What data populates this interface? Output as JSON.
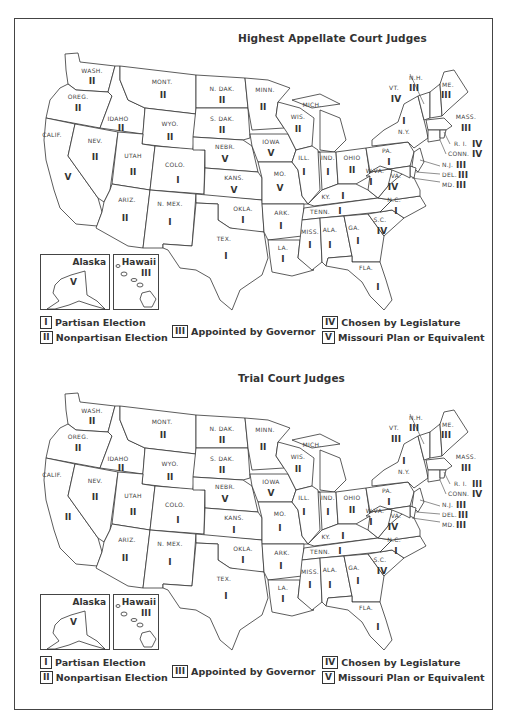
{
  "legend": [
    {
      "code": "I",
      "label": "Partisan Election"
    },
    {
      "code": "II",
      "label": "Nonpartisan Election"
    },
    {
      "code": "III",
      "label": "Appointed by Governor"
    },
    {
      "code": "IV",
      "label": "Chosen by Legislature"
    },
    {
      "code": "V",
      "label": "Missouri Plan or Equivalent"
    }
  ],
  "maps": [
    {
      "title": "Highest Appellate Court Judges",
      "alaska": {
        "name": "Alaska",
        "code": "V"
      },
      "hawaii": {
        "name": "Hawaii",
        "code": "III"
      },
      "states": {
        "WASH": {
          "label": "WASH.",
          "code": "II"
        },
        "OREG": {
          "label": "OREG.",
          "code": "II"
        },
        "CALIF": {
          "label": "CALIF.",
          "code": "V"
        },
        "IDAHO": {
          "label": "IDAHO",
          "code": "II"
        },
        "NEV": {
          "label": "NEV.",
          "code": "II"
        },
        "MONT": {
          "label": "MONT.",
          "code": "II"
        },
        "WYO": {
          "label": "WYO.",
          "code": "II"
        },
        "UTAH": {
          "label": "UTAH",
          "code": "II"
        },
        "COLO": {
          "label": "COLO.",
          "code": "I"
        },
        "ARIZ": {
          "label": "ARIZ.",
          "code": "II"
        },
        "NMEX": {
          "label": "N. MEX.",
          "code": "I"
        },
        "NDAK": {
          "label": "N. DAK.",
          "code": "II"
        },
        "SDAK": {
          "label": "S. DAK.",
          "code": "II"
        },
        "NEBR": {
          "label": "NEBR.",
          "code": "V"
        },
        "KANS": {
          "label": "KANS.",
          "code": "V"
        },
        "OKLA": {
          "label": "OKLA.",
          "code": "I"
        },
        "TEX": {
          "label": "TEX.",
          "code": "I"
        },
        "MINN": {
          "label": "MINN.",
          "code": "II"
        },
        "IOWA": {
          "label": "IOWA",
          "code": "V"
        },
        "MO": {
          "label": "MO.",
          "code": "V"
        },
        "ARK": {
          "label": "ARK.",
          "code": "I"
        },
        "LA": {
          "label": "LA.",
          "code": "I"
        },
        "WIS": {
          "label": "WIS.",
          "code": "II"
        },
        "ILL": {
          "label": "ILL.",
          "code": "I"
        },
        "MICH": {
          "label": "MICH.",
          "code": ""
        },
        "IND": {
          "label": "IND.",
          "code": "I"
        },
        "OHIO": {
          "label": "OHIO",
          "code": "II"
        },
        "KY": {
          "label": "KY.",
          "code": "I"
        },
        "TENN": {
          "label": "TENN.",
          "code": "I"
        },
        "MISS": {
          "label": "MISS.",
          "code": "I"
        },
        "ALA": {
          "label": "ALA.",
          "code": "I"
        },
        "GA": {
          "label": "GA.",
          "code": "I"
        },
        "FLA": {
          "label": "FLA.",
          "code": "I"
        },
        "SC": {
          "label": "S.C.",
          "code": "IV"
        },
        "NC": {
          "label": "N.C.",
          "code": "I"
        },
        "VA": {
          "label": "VA.",
          "code": "IV"
        },
        "WVA": {
          "label": "W.VA.",
          "code": "I"
        },
        "PA": {
          "label": "PA.",
          "code": "I"
        },
        "NY": {
          "label": "N.Y.",
          "code": "I"
        },
        "VT": {
          "label": "VT.",
          "code": "IV"
        },
        "NH": {
          "label": "N.H.",
          "code": "III"
        },
        "ME": {
          "label": "ME.",
          "code": "III"
        },
        "MASS": {
          "label": "MASS.",
          "code": "III"
        },
        "RI": {
          "label": "R. I.",
          "code": "IV"
        },
        "CONN": {
          "label": "CONN.",
          "code": "IV"
        },
        "NJ": {
          "label": "N.J.",
          "code": "III"
        },
        "DEL": {
          "label": "DEL.",
          "code": "III"
        },
        "MD": {
          "label": "MD.",
          "code": "III"
        }
      }
    },
    {
      "title": "Trial Court Judges",
      "alaska": {
        "name": "Alaska",
        "code": "V"
      },
      "hawaii": {
        "name": "Hawaii",
        "code": "III"
      },
      "states": {
        "WASH": {
          "label": "WASH.",
          "code": "II"
        },
        "OREG": {
          "label": "OREG.",
          "code": "II"
        },
        "CALIF": {
          "label": "CALIF.",
          "code": "II"
        },
        "IDAHO": {
          "label": "IDAHO",
          "code": "II"
        },
        "NEV": {
          "label": "NEV.",
          "code": "II"
        },
        "MONT": {
          "label": "MONT.",
          "code": "II"
        },
        "WYO": {
          "label": "WYO.",
          "code": "II"
        },
        "UTAH": {
          "label": "UTAH",
          "code": "II"
        },
        "COLO": {
          "label": "COLO.",
          "code": "I"
        },
        "ARIZ": {
          "label": "ARIZ.",
          "code": "II"
        },
        "NMEX": {
          "label": "N. MEX.",
          "code": "I"
        },
        "NDAK": {
          "label": "N. DAK.",
          "code": "II"
        },
        "SDAK": {
          "label": "S. DAK.",
          "code": "II"
        },
        "NEBR": {
          "label": "NEBR.",
          "code": "V"
        },
        "KANS": {
          "label": "KANS.",
          "code": "I"
        },
        "OKLA": {
          "label": "OKLA.",
          "code": "I"
        },
        "TEX": {
          "label": "TEX.",
          "code": "I"
        },
        "MINN": {
          "label": "MINN.",
          "code": "II"
        },
        "IOWA": {
          "label": "IOWA",
          "code": "V"
        },
        "MO": {
          "label": "MO.",
          "code": "I"
        },
        "ARK": {
          "label": "ARK.",
          "code": "I"
        },
        "LA": {
          "label": "LA.",
          "code": "I"
        },
        "WIS": {
          "label": "WIS.",
          "code": "II"
        },
        "ILL": {
          "label": "ILL.",
          "code": "I"
        },
        "MICH": {
          "label": "MICH.",
          "code": ""
        },
        "IND": {
          "label": "IND.",
          "code": "I"
        },
        "OHIO": {
          "label": "OHIO",
          "code": "II"
        },
        "KY": {
          "label": "KY.",
          "code": "I"
        },
        "TENN": {
          "label": "TENN.",
          "code": "I"
        },
        "MISS": {
          "label": "MISS.",
          "code": "I"
        },
        "ALA": {
          "label": "ALA.",
          "code": "I"
        },
        "GA": {
          "label": "GA.",
          "code": "I"
        },
        "FLA": {
          "label": "FLA.",
          "code": "I"
        },
        "SC": {
          "label": "S.C.",
          "code": "IV"
        },
        "NC": {
          "label": "N.C.",
          "code": "I"
        },
        "VA": {
          "label": "VA.",
          "code": "IV"
        },
        "WVA": {
          "label": "W.VA.",
          "code": "I"
        },
        "PA": {
          "label": "PA.",
          "code": "I"
        },
        "NY": {
          "label": "N.Y.",
          "code": "I"
        },
        "VT": {
          "label": "VT.",
          "code": "III"
        },
        "NH": {
          "label": "N.H.",
          "code": "III"
        },
        "ME": {
          "label": "ME.",
          "code": "III"
        },
        "MASS": {
          "label": "MASS.",
          "code": "III"
        },
        "RI": {
          "label": "R. I.",
          "code": "III"
        },
        "CONN": {
          "label": "CONN.",
          "code": "IV"
        },
        "NJ": {
          "label": "N.J.",
          "code": "III"
        },
        "DEL": {
          "label": "DEL.",
          "code": "III"
        },
        "MD": {
          "label": "MD.",
          "code": "III"
        }
      }
    }
  ]
}
